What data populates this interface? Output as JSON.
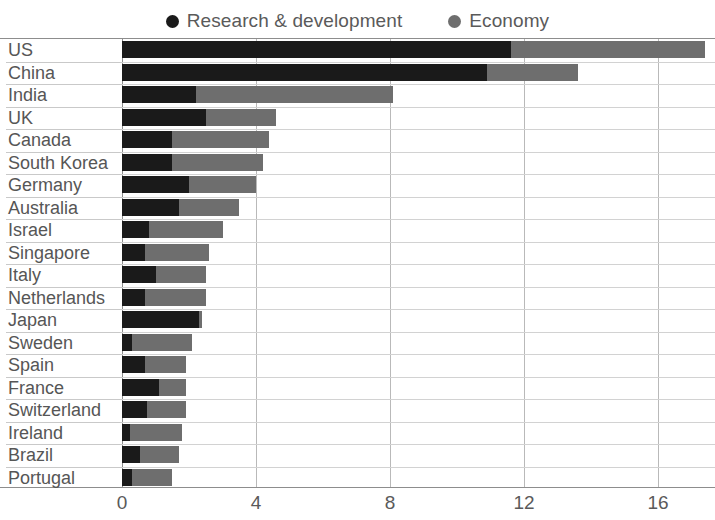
{
  "legend": {
    "items": [
      {
        "label": "Research & development",
        "color": "#1a1a1a",
        "icon": "dot-icon"
      },
      {
        "label": "Economy",
        "color": "#6e6e6e",
        "icon": "dot-icon"
      }
    ]
  },
  "chart_data": {
    "type": "bar",
    "orientation": "horizontal",
    "stacked": true,
    "title": "",
    "xlabel": "",
    "ylabel": "",
    "xlim": [
      0,
      17.7
    ],
    "xticks": [
      0,
      4,
      8,
      12,
      16
    ],
    "xtick_labels": [
      "0",
      "4",
      "8",
      "12",
      "16"
    ],
    "grid": true,
    "legend_position": "top-center",
    "categories": [
      "US",
      "China",
      "India",
      "UK",
      "Canada",
      "South Korea",
      "Germany",
      "Australia",
      "Israel",
      "Singapore",
      "Italy",
      "Netherlands",
      "Japan",
      "Sweden",
      "Spain",
      "France",
      "Switzerland",
      "Ireland",
      "Brazil",
      "Portugal"
    ],
    "series": [
      {
        "name": "Research & development",
        "color": "#1a1a1a",
        "values": [
          11.6,
          10.9,
          2.2,
          2.5,
          1.5,
          1.5,
          2.0,
          1.7,
          0.8,
          0.7,
          1.0,
          0.7,
          2.3,
          0.3,
          0.7,
          1.1,
          0.75,
          0.25,
          0.55,
          0.3
        ]
      },
      {
        "name": "Economy",
        "color": "#6e6e6e",
        "values": [
          5.8,
          2.7,
          5.9,
          2.1,
          2.9,
          2.7,
          2.0,
          1.8,
          2.2,
          1.9,
          1.5,
          1.8,
          0.1,
          1.8,
          1.2,
          0.8,
          1.15,
          1.55,
          1.15,
          1.2
        ]
      }
    ],
    "totals": [
      17.4,
      13.6,
      8.1,
      4.6,
      4.4,
      4.2,
      4.0,
      3.5,
      3.0,
      2.6,
      2.5,
      2.5,
      2.4,
      2.1,
      1.9,
      1.9,
      1.9,
      1.8,
      1.7,
      1.5
    ]
  }
}
